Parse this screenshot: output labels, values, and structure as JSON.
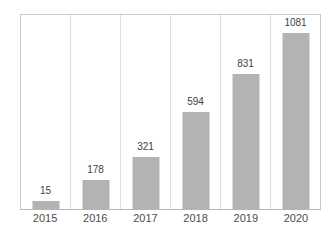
{
  "chart_data": {
    "type": "bar",
    "categories": [
      "2015",
      "2016",
      "2017",
      "2018",
      "2019",
      "2020"
    ],
    "values": [
      15,
      178,
      321,
      594,
      831,
      1081
    ],
    "value_labels": [
      "15",
      "178",
      "321",
      "594",
      "831",
      "1081"
    ],
    "title": "",
    "xlabel": "",
    "ylabel": "",
    "ylim": [
      0,
      1081
    ],
    "grid": "vertical-category-separators",
    "legend": "none",
    "data_labels_position": "above-bars",
    "colors": {
      "background": "#ffffff",
      "bar": "#b3b3b3",
      "frame_border": "#c9c9c9",
      "axis_line": "#b5b5b5",
      "gridline": "#dedede",
      "value_label_text": "#3f3f3f",
      "tick_label_text": "#4b4b4b"
    }
  }
}
